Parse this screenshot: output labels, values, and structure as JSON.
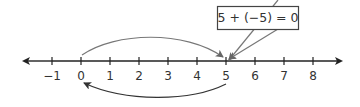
{
  "diagram": {
    "type": "number-line",
    "equation_label": "5 + (−5) = 0",
    "ticks": [
      {
        "value": -1,
        "label": "−1"
      },
      {
        "value": 0,
        "label": "0"
      },
      {
        "value": 1,
        "label": "1"
      },
      {
        "value": 2,
        "label": "2"
      },
      {
        "value": 3,
        "label": "3"
      },
      {
        "value": 4,
        "label": "4"
      },
      {
        "value": 5,
        "label": "5"
      },
      {
        "value": 6,
        "label": "6"
      },
      {
        "value": 7,
        "label": "7"
      },
      {
        "value": 8,
        "label": "8"
      }
    ],
    "arrows": [
      {
        "name": "add-five-arc",
        "from": 0,
        "to": 5,
        "position": "above"
      },
      {
        "name": "subtract-five-arc",
        "from": 5,
        "to": 0,
        "position": "below"
      }
    ],
    "colors": {
      "axis": "#222222",
      "arc": "#777777",
      "lower_arc": "#333333",
      "box_border": "#444444",
      "text": "#333333"
    }
  }
}
